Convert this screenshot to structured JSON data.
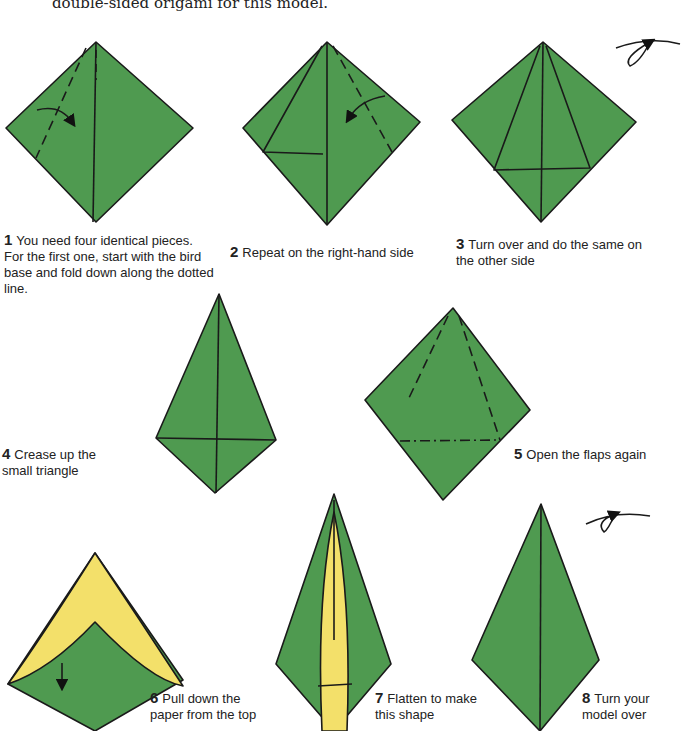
{
  "intro_text": "double-sided origami for this model.",
  "colors": {
    "paper_green": "#4f9a50",
    "paper_yellow": "#f3e06a",
    "line": "#1a1a1a"
  },
  "steps": [
    {
      "number": "1",
      "text": "You need four identical pieces. For the first one, start with the bird base and fold down along the dotted line."
    },
    {
      "number": "2",
      "text": "Repeat on the right-hand side"
    },
    {
      "number": "3",
      "text": "Turn over and do the same on the other side"
    },
    {
      "number": "4",
      "text": "Crease up the small triangle"
    },
    {
      "number": "5",
      "text": "Open the flaps again"
    },
    {
      "number": "6",
      "text": "Pull down the paper from the top"
    },
    {
      "number": "7",
      "text": "Flatten to make this shape"
    },
    {
      "number": "8",
      "text": "Turn your model over"
    }
  ],
  "icons": [
    "fold-arrow-icon",
    "turn-over-icon"
  ]
}
